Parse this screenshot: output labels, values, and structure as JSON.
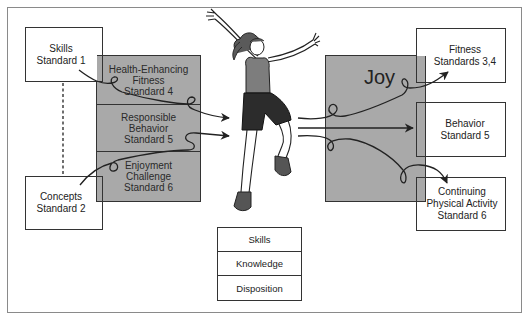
{
  "diagram": {
    "left_inputs": [
      {
        "id": "skills",
        "label": "Skills\nStandard 1"
      },
      {
        "id": "concepts",
        "label": "Concepts\nStandard 2"
      }
    ],
    "left_process": {
      "segments": [
        {
          "label": "Health-Enhancing\nFitness\nStandard 4"
        },
        {
          "label": "Responsible\nBehavior\nStandard 5"
        },
        {
          "label": "Enjoyment\nChallenge\nStandard 6"
        }
      ]
    },
    "center": {
      "figure": "jumping-girl-illustration",
      "attributes": [
        {
          "label": "Skills"
        },
        {
          "label": "Knowledge"
        },
        {
          "label": "Disposition"
        }
      ]
    },
    "right_process": {
      "label": "Joy"
    },
    "right_outcomes": [
      {
        "id": "fitness",
        "label": "Fitness\nStandards 3,4"
      },
      {
        "id": "behavior",
        "label": "Behavior\nStandard 5"
      },
      {
        "id": "continuing",
        "label": "Continuing\nPhysical Activity\nStandard 6"
      }
    ],
    "colors": {
      "grey_fill": "#a9a9a9",
      "line": "#333333",
      "frame": "#8a8a8a"
    }
  }
}
